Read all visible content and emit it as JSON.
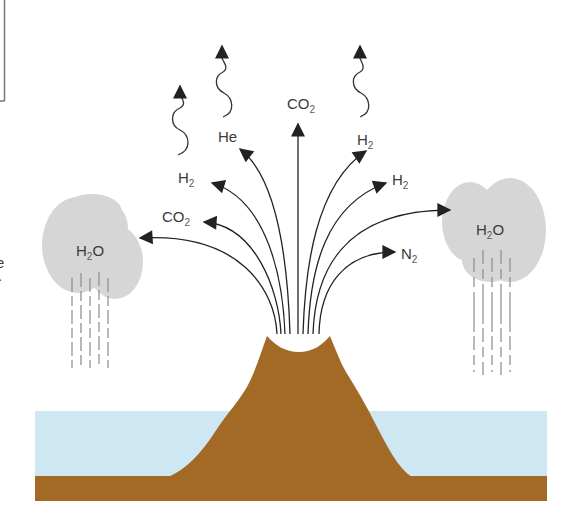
{
  "diagram": {
    "title": "",
    "colors": {
      "ocean": "#cde8f2",
      "ground": "#a36a25",
      "cloud": "#d6d6d6",
      "arrow": "#222222",
      "rain": "#8a8a8a",
      "label": "#3a3a3a"
    },
    "edge_fragments": {
      "frame_line": "",
      "text_1": "e",
      "text_2": "."
    },
    "gases": {
      "escaping": [
        {
          "formula": "H",
          "subscript": "2",
          "note": "escapes to space (wavy arrow)"
        },
        {
          "formula": "He",
          "subscript": "",
          "note": "escapes to space (wavy arrow)"
        },
        {
          "formula": "H",
          "subscript": "2",
          "note": "escapes to space (wavy arrow)"
        }
      ],
      "emitted": [
        {
          "formula": "CO",
          "subscript": "2",
          "direction": "left, into cloud"
        },
        {
          "formula": "CO",
          "subscript": "2",
          "direction": "upper-left"
        },
        {
          "formula": "H",
          "subscript": "2",
          "direction": "upper-left"
        },
        {
          "formula": "CO",
          "subscript": "2",
          "direction": "straight up"
        },
        {
          "formula": "H",
          "subscript": "2",
          "direction": "upper-right"
        },
        {
          "formula": "H",
          "subscript": "2",
          "direction": "right"
        },
        {
          "formula": "N",
          "subscript": "2",
          "direction": "right, low"
        },
        {
          "formula": "",
          "subscript": "",
          "direction": "right, into cloud"
        }
      ]
    },
    "clouds": [
      {
        "id": "left",
        "formula": "H",
        "subscript": "2",
        "suffix": "O"
      },
      {
        "id": "right",
        "formula": "H",
        "subscript": "2",
        "suffix": "O"
      }
    ],
    "labels": {
      "wavy_left": {
        "main": "H",
        "sub": "2"
      },
      "wavy_mid": {
        "main": "He",
        "sub": ""
      },
      "wavy_right": {
        "main": "H",
        "sub": "2"
      },
      "co2_top": {
        "main": "CO",
        "sub": "2"
      },
      "h2_upper_left": {
        "main": "H",
        "sub": "2"
      },
      "co2_left": {
        "main": "CO",
        "sub": "2"
      },
      "h2_upper_right": {
        "main": "H",
        "sub": "2"
      },
      "h2_right": {
        "main": "H",
        "sub": "2"
      },
      "n2_right": {
        "main": "N",
        "sub": "2"
      },
      "cloud_left": {
        "main": "H",
        "sub": "2",
        "suffix": "O"
      },
      "cloud_right": {
        "main": "H",
        "sub": "2",
        "suffix": "O"
      }
    }
  }
}
